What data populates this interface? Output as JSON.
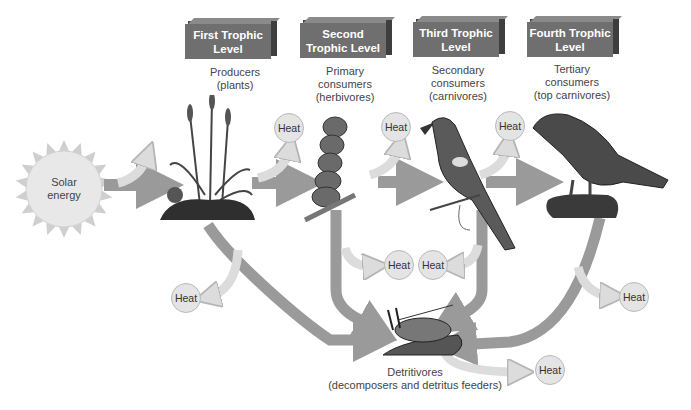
{
  "colors": {
    "main_arrow": "#9a9a9a",
    "heat_arrow": "#dcdcdc",
    "heat_circle": "#e4e4e4",
    "level_box": "#6f6f6f",
    "sun": "#e8e8e8"
  },
  "source": {
    "label": "Solar\nenergy",
    "icon": "sun-icon"
  },
  "levels": [
    {
      "title": "First Trophic\nLevel",
      "desc": "Producers\n(plants)",
      "icon": "plants-icon"
    },
    {
      "title": "Second Trophic\nLevel",
      "desc": "Primary\nconsumers\n(herbivores)",
      "icon": "caterpillar-icon"
    },
    {
      "title": "Third Trophic\nLevel",
      "desc": "Secondary\nconsumers\n(carnivores)",
      "icon": "bird-icon"
    },
    {
      "title": "Fourth Trophic\nLevel",
      "desc": "Tertiary\nconsumers\n(top carnivores)",
      "icon": "hawk-icon"
    }
  ],
  "detritivores": {
    "label": "Detritivores\n(decomposers and detritus feeders)",
    "icon": "detritivore-icon"
  },
  "heat_label": "Heat",
  "heat_nodes": [
    {
      "id": "heat-1",
      "label": "Heat"
    },
    {
      "id": "heat-2",
      "label": "Heat"
    },
    {
      "id": "heat-3",
      "label": "Heat"
    },
    {
      "id": "heat-4",
      "label": "Heat"
    },
    {
      "id": "heat-5",
      "label": "Heat"
    },
    {
      "id": "heat-6",
      "label": "Heat"
    },
    {
      "id": "heat-7",
      "label": "Heat"
    },
    {
      "id": "heat-8",
      "label": "Heat"
    }
  ]
}
